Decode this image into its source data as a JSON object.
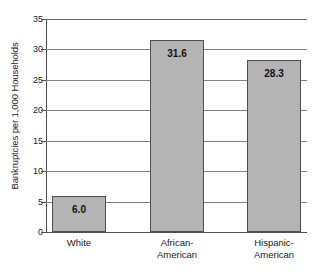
{
  "chart_data": {
    "type": "bar",
    "title": "",
    "xlabel": "",
    "ylabel": "Bankruptcies per 1,000 Households",
    "categories": [
      "White",
      "African-American",
      "Hispanic-American"
    ],
    "category_lines": [
      [
        "White"
      ],
      [
        "African-",
        "American"
      ],
      [
        "Hispanic-",
        "American"
      ]
    ],
    "values": [
      6.0,
      31.6,
      28.3
    ],
    "value_labels": [
      "6.0",
      "31.6",
      "28.3"
    ],
    "ylim": [
      0,
      35
    ],
    "ytick_values": [
      35,
      30,
      25,
      20,
      15,
      10,
      5,
      0
    ],
    "ytick_labels": [
      "35",
      "30",
      "25",
      "20",
      "15",
      "10",
      "5",
      "0"
    ],
    "ytick_step": 5,
    "grid": "horizontal",
    "legend": "none",
    "bar_fill_color": "#b4b4b4",
    "bar_border_color": "#4d4d4d",
    "gridline_color": "#808080",
    "axis_color": "#4d4d4d",
    "background_color": "#ffffff"
  }
}
